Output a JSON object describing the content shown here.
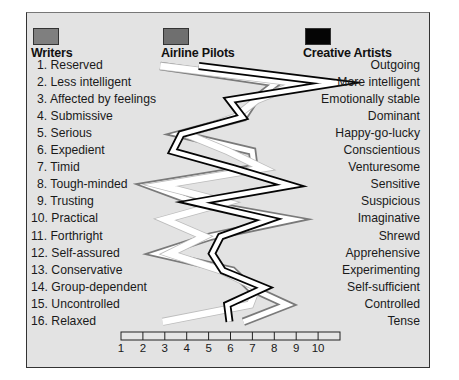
{
  "chart_data": {
    "type": "line",
    "title": "",
    "orientation": "vertical-profile",
    "xlabel": "",
    "ylabel": "",
    "xlim": [
      1,
      11
    ],
    "x_ticks": [
      "1",
      "2",
      "3",
      "4",
      "5",
      "6",
      "7",
      "8",
      "9",
      "10"
    ],
    "legend_position": "top",
    "categories_left": [
      "1. Reserved",
      "2. Less intelligent",
      "3. Affected by feelings",
      "4. Submissive",
      "5. Serious",
      "6. Expedient",
      "7. Timid",
      "8. Tough-minded",
      "9. Trusting",
      "10. Practical",
      "11. Forthright",
      "12. Self-assured",
      "13. Conservative",
      "14. Group-dependent",
      "15. Uncontrolled",
      "16. Relaxed"
    ],
    "categories_right": [
      "Outgoing",
      "More intelligent",
      "Emotionally stable",
      "Dominant",
      "Happy-go-lucky",
      "Conscientious",
      "Venturesome",
      "Sensitive",
      "Suspicious",
      "Imaginative",
      "Shrewd",
      "Apprehensive",
      "Experimenting",
      "Self-sufficient",
      "Controlled",
      "Tense"
    ],
    "series": [
      {
        "name": "Writers",
        "style": "grey-outline",
        "values": [
          2.7,
          8.0,
          7.0,
          6.5,
          3.6,
          6.9,
          7.0,
          2.2,
          4.3,
          8.7,
          5.0,
          2.6,
          6.0,
          6.8,
          8.5,
          6.5
        ]
      },
      {
        "name": "Airline Pilots",
        "style": "white-band",
        "values": [
          2.8,
          9.1,
          7.2,
          6.2,
          4.0,
          5.9,
          7.5,
          2.8,
          5.8,
          3.0,
          4.8,
          3.2,
          5.6,
          7.2,
          6.9,
          2.9
        ]
      },
      {
        "name": "Creative Artists",
        "style": "black-outline",
        "values": [
          4.6,
          10.9,
          6.0,
          6.6,
          3.8,
          3.4,
          6.2,
          8.8,
          4.4,
          7.8,
          5.6,
          5.2,
          5.7,
          7.6,
          5.9,
          6.0
        ]
      }
    ]
  },
  "legend": {
    "writers": {
      "label": "Writers",
      "color": "#7a7a7a"
    },
    "pilots": {
      "label": "Airline Pilots",
      "color": "#6e6e6e"
    },
    "artists": {
      "label": "Creative Artists",
      "color": "#050505"
    }
  },
  "colors": {
    "panel_bg": "#e3e3e3",
    "frame": "#333333"
  }
}
